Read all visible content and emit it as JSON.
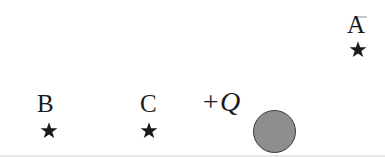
{
  "figure": {
    "kind": "physics-electrostatics-diagram",
    "background_color": "#ffffff",
    "width": 385,
    "height": 157
  },
  "labels": {
    "point_a": "A",
    "point_b": "B",
    "point_c": "C",
    "charge": "+Q"
  },
  "markers": {
    "star_glyph": "★",
    "star_color": "#1a1a1a"
  },
  "charge_sphere": {
    "fill_color": "#8e8e8e",
    "stroke_color": "#3a3a3a",
    "diameter_px": 43,
    "center_x": 274,
    "center_y": 131
  },
  "artifact": {
    "scan_line_color": "#b4b4b4"
  }
}
